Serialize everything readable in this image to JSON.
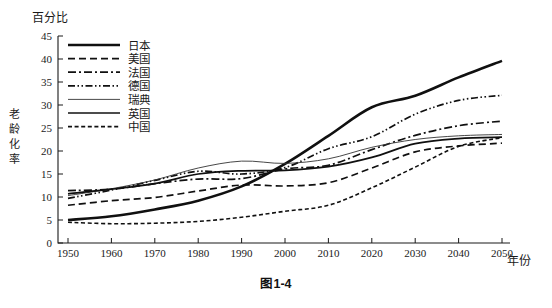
{
  "figure": {
    "caption": "图1-4",
    "y_unit_label": "百分比",
    "y_axis_title": "老龄化率",
    "x_axis_title": "年份"
  },
  "chart_data": {
    "type": "line",
    "title": "图1-4",
    "xlabel": "年份",
    "ylabel": "老龄化率",
    "y_unit": "百分比",
    "xlim": [
      1950,
      2050
    ],
    "ylim": [
      0,
      45
    ],
    "xticks": [
      1950,
      1960,
      1970,
      1980,
      1990,
      2000,
      2010,
      2020,
      2030,
      2040,
      2050
    ],
    "yticks": [
      0,
      5,
      10,
      15,
      20,
      25,
      30,
      35,
      40,
      45
    ],
    "grid": false,
    "legend_position": "upper-left-inside",
    "x": [
      1950,
      1960,
      1970,
      1980,
      1990,
      2000,
      2010,
      2020,
      2030,
      2040,
      2050
    ],
    "series": [
      {
        "name": "日本",
        "style": "solid-thick",
        "color": "#101010",
        "values": [
          5.0,
          5.8,
          7.3,
          9.2,
          12.3,
          17.2,
          23.3,
          29.5,
          32.0,
          36.0,
          39.6
        ]
      },
      {
        "name": "美国",
        "style": "dashed",
        "color": "#101010",
        "values": [
          8.2,
          9.2,
          9.9,
          11.3,
          12.6,
          12.4,
          13.1,
          16.3,
          19.8,
          21.1,
          21.7
        ]
      },
      {
        "name": "法国",
        "style": "dash-dot",
        "color": "#101010",
        "values": [
          11.4,
          11.7,
          12.9,
          13.9,
          14.0,
          16.1,
          16.9,
          20.3,
          23.4,
          25.5,
          26.5
        ]
      },
      {
        "name": "德国",
        "style": "dash-dot-dot",
        "color": "#101010",
        "values": [
          9.7,
          11.5,
          13.6,
          15.6,
          15.0,
          16.4,
          20.5,
          23.1,
          28.0,
          31.0,
          32.1
        ]
      },
      {
        "name": "瑞典",
        "style": "solid-thin",
        "color": "#333333",
        "values": [
          10.3,
          11.8,
          13.7,
          16.3,
          17.8,
          17.3,
          18.3,
          20.8,
          22.5,
          23.3,
          23.6
        ]
      },
      {
        "name": "英国",
        "style": "solid-medium",
        "color": "#101010",
        "values": [
          10.7,
          11.7,
          12.9,
          15.0,
          15.7,
          15.8,
          16.6,
          18.6,
          21.6,
          22.7,
          23.0
        ]
      },
      {
        "name": "中国",
        "style": "fine-dashed",
        "color": "#101010",
        "values": [
          4.5,
          4.2,
          4.3,
          4.7,
          5.6,
          6.9,
          8.2,
          12.0,
          16.5,
          21.0,
          22.9
        ]
      }
    ],
    "legend_entries": [
      "日本",
      "美国",
      "法国",
      "德国",
      "瑞典",
      "英国",
      "中国"
    ]
  }
}
